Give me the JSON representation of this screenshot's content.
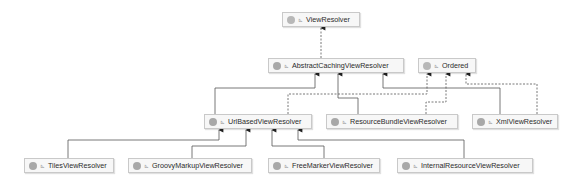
{
  "diagram": {
    "colors": {
      "edge": "#555555",
      "node_bg": "#f7f7f7",
      "node_border": "#c9c9c9",
      "icon": "#a8a8a8"
    },
    "nodes": [
      {
        "id": "view-resolver",
        "label": "ViewResolver",
        "kind": "interface",
        "icon": "interface-icon"
      },
      {
        "id": "abstract-caching",
        "label": "AbstractCachingViewResolver",
        "kind": "abstract-class",
        "icon": "class-icon"
      },
      {
        "id": "ordered",
        "label": "Ordered",
        "kind": "interface",
        "icon": "interface-icon"
      },
      {
        "id": "url-based",
        "label": "UrlBasedViewResolver",
        "kind": "class",
        "icon": "class-icon"
      },
      {
        "id": "resource-bundle",
        "label": "ResourceBundleViewResolver",
        "kind": "class",
        "icon": "class-icon"
      },
      {
        "id": "xml",
        "label": "XmlViewResolver",
        "kind": "class",
        "icon": "class-icon"
      },
      {
        "id": "tiles",
        "label": "TilesViewResolver",
        "kind": "class",
        "icon": "class-icon"
      },
      {
        "id": "groovy-markup",
        "label": "GroovyMarkupViewResolver",
        "kind": "class",
        "icon": "class-icon"
      },
      {
        "id": "freemarker",
        "label": "FreeMarkerViewResolver",
        "kind": "class",
        "icon": "class-icon"
      },
      {
        "id": "internal-resource",
        "label": "InternalResourceViewResolver",
        "kind": "class",
        "icon": "class-icon"
      }
    ],
    "visibility_glyph": "⊾",
    "edges": [
      {
        "from": "abstract-caching",
        "to": "view-resolver",
        "type": "implements"
      },
      {
        "from": "url-based",
        "to": "abstract-caching",
        "type": "extends"
      },
      {
        "from": "resource-bundle",
        "to": "abstract-caching",
        "type": "extends"
      },
      {
        "from": "xml",
        "to": "abstract-caching",
        "type": "extends"
      },
      {
        "from": "url-based",
        "to": "ordered",
        "type": "implements"
      },
      {
        "from": "resource-bundle",
        "to": "ordered",
        "type": "implements"
      },
      {
        "from": "xml",
        "to": "ordered",
        "type": "implements"
      },
      {
        "from": "tiles",
        "to": "url-based",
        "type": "extends"
      },
      {
        "from": "groovy-markup",
        "to": "url-based",
        "type": "extends"
      },
      {
        "from": "freemarker",
        "to": "url-based",
        "type": "extends"
      },
      {
        "from": "internal-resource",
        "to": "url-based",
        "type": "extends"
      }
    ]
  }
}
